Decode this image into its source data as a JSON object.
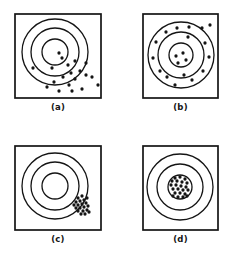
{
  "figure": {
    "background_color": "#ffffff",
    "ink_color": "#141414",
    "panel_count": 4
  },
  "panels": [
    {
      "id": "a",
      "caption": "(a)",
      "description": "Shots scattered widely and displaced low-right of center: low accuracy, low precision",
      "frame": {
        "x": 0,
        "y": 0,
        "width": 88,
        "height": 86
      },
      "target": {
        "center_x": 41,
        "center_y": 39,
        "rings": [
          33,
          24,
          13
        ]
      },
      "shots": [
        {
          "x": 45,
          "y": 40
        },
        {
          "x": 48,
          "y": 45
        },
        {
          "x": 19,
          "y": 55
        },
        {
          "x": 38,
          "y": 55
        },
        {
          "x": 54,
          "y": 52
        },
        {
          "x": 61,
          "y": 48
        },
        {
          "x": 72,
          "y": 50
        },
        {
          "x": 57,
          "y": 60
        },
        {
          "x": 66,
          "y": 58
        },
        {
          "x": 49,
          "y": 64
        },
        {
          "x": 61,
          "y": 66
        },
        {
          "x": 72,
          "y": 62
        },
        {
          "x": 78,
          "y": 64
        },
        {
          "x": 40,
          "y": 69
        },
        {
          "x": 55,
          "y": 72
        },
        {
          "x": 33,
          "y": 74
        },
        {
          "x": 45,
          "y": 78
        },
        {
          "x": 58,
          "y": 78
        },
        {
          "x": 68,
          "y": 76
        },
        {
          "x": 84,
          "y": 72
        }
      ]
    },
    {
      "id": "b",
      "caption": "(b)",
      "description": "Shots spread around the center in all directions: good accuracy, low precision",
      "frame": {
        "x": 0,
        "y": 0,
        "width": 77,
        "height": 86
      },
      "target": {
        "center_x": 39,
        "center_y": 42,
        "rings": [
          33,
          23,
          12
        ]
      },
      "shots": [
        {
          "x": 34,
          "y": 43
        },
        {
          "x": 41,
          "y": 40
        },
        {
          "x": 44,
          "y": 47
        },
        {
          "x": 36,
          "y": 50
        },
        {
          "x": 24,
          "y": 19
        },
        {
          "x": 35,
          "y": 15
        },
        {
          "x": 47,
          "y": 14
        },
        {
          "x": 60,
          "y": 15
        },
        {
          "x": 68,
          "y": 12
        },
        {
          "x": 14,
          "y": 29
        },
        {
          "x": 46,
          "y": 24
        },
        {
          "x": 63,
          "y": 30
        },
        {
          "x": 11,
          "y": 45
        },
        {
          "x": 67,
          "y": 44
        },
        {
          "x": 18,
          "y": 58
        },
        {
          "x": 25,
          "y": 64
        },
        {
          "x": 42,
          "y": 62
        },
        {
          "x": 50,
          "y": 67
        },
        {
          "x": 61,
          "y": 58
        },
        {
          "x": 33,
          "y": 72
        }
      ]
    },
    {
      "id": "c",
      "caption": "(c)",
      "description": "Shots tightly clustered but displaced to the right of center: low accuracy, high precision",
      "frame": {
        "x": 0,
        "y": 0,
        "width": 88,
        "height": 86
      },
      "target": {
        "center_x": 41,
        "center_y": 41,
        "rings": [
          33,
          24,
          13
        ]
      },
      "shots": [
        {
          "x": 64,
          "y": 53
        },
        {
          "x": 68,
          "y": 51
        },
        {
          "x": 62,
          "y": 57
        },
        {
          "x": 66,
          "y": 56
        },
        {
          "x": 70,
          "y": 55
        },
        {
          "x": 73,
          "y": 53
        },
        {
          "x": 60,
          "y": 60
        },
        {
          "x": 64,
          "y": 60
        },
        {
          "x": 68,
          "y": 59
        },
        {
          "x": 72,
          "y": 58
        },
        {
          "x": 62,
          "y": 63
        },
        {
          "x": 66,
          "y": 63
        },
        {
          "x": 70,
          "y": 62
        },
        {
          "x": 74,
          "y": 61
        },
        {
          "x": 64,
          "y": 66
        },
        {
          "x": 69,
          "y": 66
        },
        {
          "x": 73,
          "y": 65
        },
        {
          "x": 67,
          "y": 69
        },
        {
          "x": 71,
          "y": 69
        },
        {
          "x": 75,
          "y": 67
        }
      ]
    },
    {
      "id": "d",
      "caption": "(d)",
      "description": "Shots tightly clustered on the center: high accuracy, high precision",
      "frame": {
        "x": 0,
        "y": 0,
        "width": 77,
        "height": 86
      },
      "target": {
        "center_x": 38,
        "center_y": 42,
        "rings": [
          33,
          23,
          12
        ]
      },
      "shots": [
        {
          "x": 33,
          "y": 33
        },
        {
          "x": 38,
          "y": 32
        },
        {
          "x": 43,
          "y": 34
        },
        {
          "x": 30,
          "y": 36
        },
        {
          "x": 35,
          "y": 36
        },
        {
          "x": 40,
          "y": 37
        },
        {
          "x": 45,
          "y": 38
        },
        {
          "x": 29,
          "y": 40
        },
        {
          "x": 34,
          "y": 40
        },
        {
          "x": 39,
          "y": 41
        },
        {
          "x": 44,
          "y": 42
        },
        {
          "x": 31,
          "y": 44
        },
        {
          "x": 36,
          "y": 44
        },
        {
          "x": 41,
          "y": 45
        },
        {
          "x": 46,
          "y": 45
        },
        {
          "x": 33,
          "y": 48
        },
        {
          "x": 38,
          "y": 48
        },
        {
          "x": 43,
          "y": 49
        },
        {
          "x": 36,
          "y": 52
        },
        {
          "x": 41,
          "y": 52
        },
        {
          "x": 45,
          "y": 51
        },
        {
          "x": 31,
          "y": 51
        }
      ]
    }
  ]
}
